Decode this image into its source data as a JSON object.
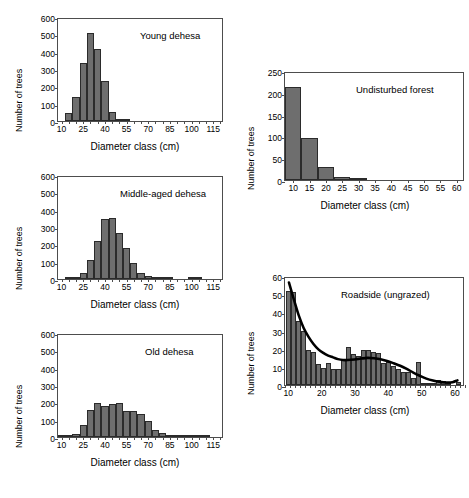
{
  "figure": {
    "ghost_header": "",
    "bar_color": "#6e6e6e",
    "bar_edge_color": "#2b2b2b",
    "axis_color": "#4d4d4d",
    "curve_color": "#000000"
  },
  "chart_data": [
    {
      "id": "young-dehesa",
      "type": "bar",
      "title": "Young dehesa",
      "xlabel": "Diameter class (cm)",
      "ylabel": "Number of trees",
      "xlim": [
        7.5,
        122.5
      ],
      "ylim": [
        0,
        600
      ],
      "yticks": [
        0,
        100,
        200,
        300,
        400,
        500,
        600
      ],
      "xticks": [
        10,
        25,
        40,
        55,
        70,
        85,
        100,
        115
      ],
      "bin_width": 5,
      "grid": false,
      "categories": [
        10,
        15,
        20,
        25,
        30,
        35,
        40,
        45,
        50,
        55,
        60,
        65,
        70,
        75,
        80,
        85,
        90,
        95,
        100,
        105,
        110,
        115,
        120
      ],
      "values": [
        0,
        45,
        140,
        332,
        508,
        415,
        228,
        53,
        8,
        2,
        0,
        0,
        0,
        0,
        0,
        0,
        0,
        0,
        0,
        0,
        0,
        0,
        0
      ]
    },
    {
      "id": "middle-aged-dehesa",
      "type": "bar",
      "title": "Middle-aged dehesa",
      "xlabel": "Diameter class (cm)",
      "ylabel": "Number of trees",
      "xlim": [
        7.5,
        122.5
      ],
      "ylim": [
        0,
        600
      ],
      "yticks": [
        0,
        100,
        200,
        300,
        400,
        500,
        600
      ],
      "xticks": [
        10,
        25,
        40,
        55,
        70,
        85,
        100,
        115
      ],
      "bin_width": 5,
      "grid": false,
      "categories": [
        10,
        15,
        20,
        25,
        30,
        35,
        40,
        45,
        50,
        55,
        60,
        65,
        70,
        75,
        80,
        85,
        90,
        95,
        100,
        105,
        110,
        115,
        120
      ],
      "values": [
        0,
        8,
        14,
        32,
        110,
        218,
        348,
        352,
        267,
        180,
        95,
        36,
        16,
        8,
        3,
        1,
        0,
        0,
        4,
        3,
        0,
        0,
        0
      ]
    },
    {
      "id": "old-dehesa",
      "type": "bar",
      "title": "Old dehesa",
      "xlabel": "Diameter class (cm)",
      "ylabel": "Number of trees",
      "xlim": [
        7.5,
        122.5
      ],
      "ylim": [
        0,
        600
      ],
      "yticks": [
        0,
        100,
        200,
        300,
        400,
        500,
        600
      ],
      "xticks": [
        10,
        25,
        40,
        55,
        70,
        85,
        100,
        115
      ],
      "bin_width": 5,
      "grid": false,
      "categories": [
        10,
        15,
        20,
        25,
        30,
        35,
        40,
        45,
        50,
        55,
        60,
        65,
        70,
        75,
        80,
        85,
        90,
        95,
        100,
        105,
        110,
        115,
        120
      ],
      "values": [
        2,
        5,
        18,
        72,
        158,
        196,
        178,
        190,
        197,
        152,
        148,
        131,
        95,
        42,
        22,
        11,
        10,
        9,
        4,
        2,
        2,
        0,
        0
      ]
    },
    {
      "id": "undisturbed-forest",
      "type": "bar",
      "title": "Undisturbed  forest",
      "xlabel": "Diameter class (cm)",
      "ylabel": "Number of trees",
      "xlim": [
        7.5,
        62.5
      ],
      "ylim": [
        0,
        250
      ],
      "yticks": [
        0,
        50,
        100,
        150,
        200,
        250
      ],
      "xticks": [
        10,
        15,
        20,
        25,
        30,
        35,
        40,
        45,
        50,
        55,
        60
      ],
      "bin_width": 5,
      "grid": false,
      "categories": [
        10,
        15,
        20,
        25,
        30,
        35,
        40,
        45,
        50,
        55,
        60
      ],
      "values": [
        213,
        97,
        29,
        7,
        3,
        0,
        0,
        0,
        0,
        0,
        0
      ]
    },
    {
      "id": "roadside-ungrazed",
      "type": "bar",
      "title": "Roadside (ungrazed)",
      "xlabel": "Diameter class (cm)",
      "ylabel": "Number of trees",
      "xlim": [
        9,
        63
      ],
      "ylim": [
        0,
        60
      ],
      "yticks": [
        0,
        10,
        20,
        30,
        40,
        50,
        60
      ],
      "xticks": [
        10,
        20,
        30,
        40,
        50,
        60
      ],
      "bin_width": 1.5,
      "grid": false,
      "has_trend_curve": true,
      "categories": [
        10,
        11.5,
        13,
        14.5,
        16,
        17.5,
        19,
        20.5,
        22,
        23.5,
        25,
        26.5,
        28,
        29.5,
        31,
        32.5,
        34,
        35.5,
        37,
        38.5,
        40,
        41.5,
        43,
        44.5,
        46,
        47.5,
        49,
        50.5,
        52,
        53.5,
        55,
        56.5,
        58,
        59.5,
        61
      ],
      "values": [
        52,
        51,
        35,
        30,
        19,
        18,
        11.5,
        9.5,
        12,
        9,
        8.8,
        14,
        21,
        17,
        16,
        19.5,
        19,
        18,
        17.5,
        12,
        12.5,
        10.5,
        9,
        7,
        7,
        4,
        12.5,
        1,
        1,
        1,
        2.5,
        2,
        1,
        0,
        1.8
      ],
      "trend_curve": [
        {
          "x": 10,
          "y": 57.5
        },
        {
          "x": 11.5,
          "y": 48
        },
        {
          "x": 13,
          "y": 39
        },
        {
          "x": 14.5,
          "y": 32
        },
        {
          "x": 16,
          "y": 27
        },
        {
          "x": 17.5,
          "y": 23
        },
        {
          "x": 19,
          "y": 20
        },
        {
          "x": 20.5,
          "y": 18
        },
        {
          "x": 22,
          "y": 16.5
        },
        {
          "x": 23.5,
          "y": 15.5
        },
        {
          "x": 25,
          "y": 14.5
        },
        {
          "x": 26.5,
          "y": 14
        },
        {
          "x": 28,
          "y": 14
        },
        {
          "x": 30,
          "y": 14.3
        },
        {
          "x": 32,
          "y": 14.8
        },
        {
          "x": 34,
          "y": 15.2
        },
        {
          "x": 36,
          "y": 15
        },
        {
          "x": 38,
          "y": 14.5
        },
        {
          "x": 40,
          "y": 13.5
        },
        {
          "x": 42,
          "y": 12.2
        },
        {
          "x": 44,
          "y": 10.8
        },
        {
          "x": 46,
          "y": 9
        },
        {
          "x": 48,
          "y": 7
        },
        {
          "x": 50,
          "y": 5.2
        },
        {
          "x": 52,
          "y": 3.6
        },
        {
          "x": 54,
          "y": 2.5
        },
        {
          "x": 56,
          "y": 1.8
        },
        {
          "x": 58,
          "y": 1.4
        },
        {
          "x": 60,
          "y": 1.6
        },
        {
          "x": 61.5,
          "y": 2.6
        }
      ]
    }
  ]
}
